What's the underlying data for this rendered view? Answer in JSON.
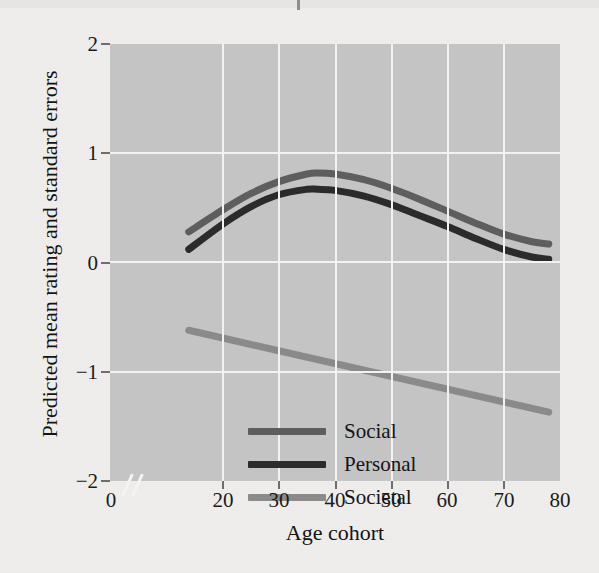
{
  "figure": {
    "background_color": "#efeeec",
    "plot_background_color": "#c4c4c4",
    "grid_color": "#f2f2f2"
  },
  "chart_data": {
    "type": "line",
    "title": "",
    "xlabel": "Age cohort",
    "ylabel": "Predicted mean rating and standard errors",
    "xlim": [
      0,
      80
    ],
    "ylim": [
      -2,
      2
    ],
    "xticks": [
      0,
      20,
      30,
      40,
      50,
      60,
      70,
      80
    ],
    "yticks": [
      2,
      1,
      0,
      -1,
      -2
    ],
    "xticklabels": [
      "0",
      "20",
      "30",
      "40",
      "50",
      "60",
      "70",
      "80"
    ],
    "yticklabels": [
      "2",
      "1",
      "0",
      "−1",
      "−2"
    ],
    "grid": true,
    "axis_break": {
      "axis": "x",
      "between": [
        0,
        20
      ],
      "glyph": "//"
    },
    "legend_position": "lower-left",
    "series": [
      {
        "name": "Social",
        "color": "#5e5e5e",
        "x": [
          14,
          20,
          25,
          30,
          35,
          37,
          40,
          45,
          50,
          55,
          60,
          65,
          70,
          75,
          78
        ],
        "y": [
          0.28,
          0.48,
          0.63,
          0.74,
          0.81,
          0.82,
          0.81,
          0.76,
          0.68,
          0.58,
          0.47,
          0.36,
          0.26,
          0.19,
          0.17
        ]
      },
      {
        "name": "Personal",
        "color": "#2b2b2b",
        "x": [
          14,
          20,
          25,
          30,
          35,
          37,
          40,
          45,
          50,
          55,
          60,
          65,
          70,
          75,
          78
        ],
        "y": [
          0.12,
          0.35,
          0.51,
          0.62,
          0.67,
          0.67,
          0.66,
          0.61,
          0.53,
          0.43,
          0.33,
          0.22,
          0.12,
          0.05,
          0.03
        ]
      },
      {
        "name": "Societal",
        "color": "#8a8a8a",
        "x": [
          14,
          78
        ],
        "y": [
          -0.62,
          -1.37
        ]
      }
    ]
  },
  "legend": {
    "items": [
      {
        "label": "Social",
        "color": "#5e5e5e"
      },
      {
        "label": "Personal",
        "color": "#2b2b2b"
      },
      {
        "label": "Societal",
        "color": "#8a8a8a"
      }
    ]
  }
}
